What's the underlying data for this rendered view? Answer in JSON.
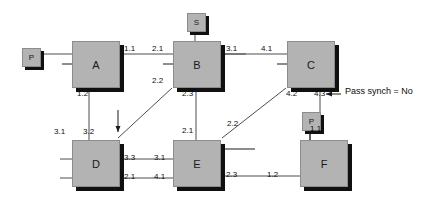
{
  "diagram": {
    "background": "#ffffff",
    "node_fill": "#b3b3b3",
    "node_shadow": "#101010",
    "line_color": "#4d4d4d",
    "nodes": [
      {
        "id": "P1",
        "label": "P",
        "size": "small",
        "x": 22,
        "y": 48
      },
      {
        "id": "S",
        "label": "S",
        "size": "small",
        "x": 187,
        "y": 13
      },
      {
        "id": "P2",
        "label": "P",
        "size": "small",
        "x": 302,
        "y": 112
      },
      {
        "id": "A",
        "label": "A",
        "size": "big",
        "x": 72,
        "y": 41
      },
      {
        "id": "B",
        "label": "B",
        "size": "big",
        "x": 173,
        "y": 41
      },
      {
        "id": "C",
        "label": "C",
        "size": "big",
        "x": 287,
        "y": 41
      },
      {
        "id": "D",
        "label": "D",
        "size": "big",
        "x": 72,
        "y": 140
      },
      {
        "id": "E",
        "label": "E",
        "size": "big",
        "x": 173,
        "y": 140
      },
      {
        "id": "F",
        "label": "F",
        "size": "big",
        "x": 300,
        "y": 140
      }
    ],
    "edge_labels": [
      {
        "id": "a-out-top",
        "text": "1.1",
        "x": 124,
        "y": 44
      },
      {
        "id": "b-in-top",
        "text": "2.1",
        "x": 152,
        "y": 44
      },
      {
        "id": "b-out-right",
        "text": "3.1",
        "x": 226,
        "y": 44
      },
      {
        "id": "c-in-left",
        "text": "4.1",
        "x": 261,
        "y": 44
      },
      {
        "id": "a-out-bot",
        "text": "1.2",
        "x": 77,
        "y": 89
      },
      {
        "id": "b-in-diag",
        "text": "2.2",
        "x": 152,
        "y": 76
      },
      {
        "id": "b-out-bot",
        "text": "2.3",
        "x": 182,
        "y": 89
      },
      {
        "id": "c-out-diagl",
        "text": "4.2",
        "x": 286,
        "y": 89
      },
      {
        "id": "c-out-bot",
        "text": "4.3",
        "x": 314,
        "y": 89
      },
      {
        "id": "d-in-left",
        "text": "3.1",
        "x": 54,
        "y": 127
      },
      {
        "id": "d-in-top",
        "text": "3.2",
        "x": 83,
        "y": 127
      },
      {
        "id": "e-in-top",
        "text": "2.1",
        "x": 182,
        "y": 126
      },
      {
        "id": "e-in-diag",
        "text": "2.2",
        "x": 227,
        "y": 119
      },
      {
        "id": "f-in-top",
        "text": "1.1",
        "x": 310,
        "y": 124
      },
      {
        "id": "d-out-up",
        "text": "3.3",
        "x": 124,
        "y": 153
      },
      {
        "id": "e-in-right1",
        "text": "3.1",
        "x": 154,
        "y": 153
      },
      {
        "id": "d-out-low",
        "text": "2.1",
        "x": 124,
        "y": 172
      },
      {
        "id": "e-in-low",
        "text": "4.1",
        "x": 154,
        "y": 172
      },
      {
        "id": "e-out-right",
        "text": "2.3",
        "x": 226,
        "y": 170
      },
      {
        "id": "f-in-left",
        "text": "1.2",
        "x": 267,
        "y": 170
      }
    ],
    "annotation": {
      "text": "Pass synch = No",
      "x": 345,
      "y": 92
    }
  }
}
